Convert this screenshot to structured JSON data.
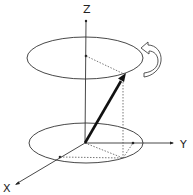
{
  "diagram": {
    "type": "3d-vector-rotation",
    "labels": {
      "z": "Z",
      "y": "Y",
      "x": "X"
    },
    "colors": {
      "line": "#333333",
      "dotted": "#555555",
      "vector": "#111111",
      "background": "#ffffff"
    },
    "elements": {
      "axes": [
        "Z",
        "Y",
        "X"
      ],
      "ellipses": [
        "top-precession-circle",
        "bottom-base-circle"
      ],
      "vector": "bold-arrow-from-origin",
      "rotation_arrow": "curved-counterclockwise-arrow"
    }
  }
}
